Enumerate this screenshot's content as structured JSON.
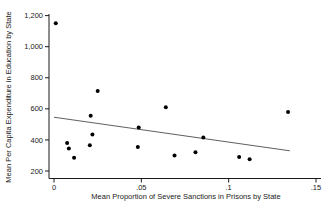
{
  "figure": {
    "background": "#ffffff",
    "width": 334,
    "height": 213
  },
  "chart_data": {
    "type": "scatter",
    "title": "",
    "xlabel": "Mean Proportion of Severe Sanctions in Prisons by State",
    "ylabel": "Mean Per Capita Expenditure in Education by State",
    "xlim": [
      0,
      0.15
    ],
    "ylim": [
      200,
      1200
    ],
    "grid": false,
    "legend": null,
    "x_ticks": [
      {
        "value": 0,
        "label": "0"
      },
      {
        "value": 0.05,
        "label": ".05"
      },
      {
        "value": 0.1,
        "label": ".1"
      },
      {
        "value": 0.15,
        "label": ".15"
      }
    ],
    "y_ticks": [
      {
        "value": 200,
        "label": "200"
      },
      {
        "value": 400,
        "label": "400"
      },
      {
        "value": 600,
        "label": "600"
      },
      {
        "value": 800,
        "label": "800"
      },
      {
        "value": 1000,
        "label": "1,000"
      },
      {
        "value": 1200,
        "label": "1,200"
      }
    ],
    "points": [
      {
        "x": 0.001,
        "y": 1150
      },
      {
        "x": 0.0075,
        "y": 380
      },
      {
        "x": 0.0085,
        "y": 345
      },
      {
        "x": 0.0115,
        "y": 285
      },
      {
        "x": 0.0205,
        "y": 365
      },
      {
        "x": 0.021,
        "y": 555
      },
      {
        "x": 0.022,
        "y": 435
      },
      {
        "x": 0.025,
        "y": 715
      },
      {
        "x": 0.048,
        "y": 355
      },
      {
        "x": 0.0485,
        "y": 480
      },
      {
        "x": 0.064,
        "y": 610
      },
      {
        "x": 0.069,
        "y": 300
      },
      {
        "x": 0.081,
        "y": 320
      },
      {
        "x": 0.0855,
        "y": 415
      },
      {
        "x": 0.106,
        "y": 290
      },
      {
        "x": 0.112,
        "y": 275
      },
      {
        "x": 0.134,
        "y": 580
      }
    ],
    "fit_line": {
      "x1": 0.0,
      "y1": 546,
      "x2": 0.135,
      "y2": 330
    },
    "point_color": "#000000",
    "line_color": "#4d4d4d",
    "axis_color": "#1a1a1a"
  }
}
